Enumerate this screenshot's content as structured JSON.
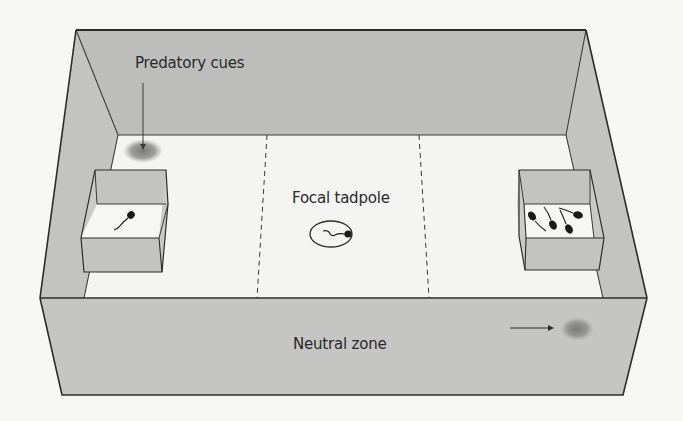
{
  "figure": {
    "type": "experimental tank diagram",
    "labels": {
      "predatory_cues": "Predatory cues",
      "focal_tadpole": "Focal tadpole",
      "neutral_zone": "Neutral zone"
    },
    "zones": [
      "left zone (predator side)",
      "central zone",
      "right zone (conspecific side)"
    ],
    "left_cage": {
      "tadpole_count": 1
    },
    "right_cage": {
      "tadpole_count": 4
    },
    "center": {
      "tadpole_count": 1,
      "encircled": true
    },
    "colors": {
      "wall": "#bdbdbb",
      "wall_dark": "#b3b3b1",
      "floor": "#f4f4f2",
      "outline": "#2c2c2c",
      "cue_blob": "#8a8a88",
      "background": "#f6f6f4"
    }
  }
}
